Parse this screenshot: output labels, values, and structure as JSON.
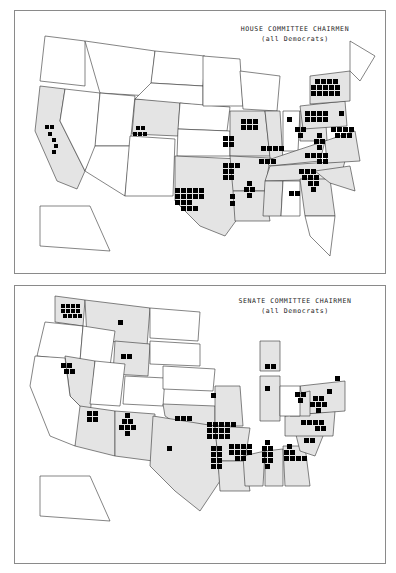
{
  "maps": [
    {
      "title": "HOUSE COMMITTEE CHAIRMEN",
      "subtitle": "(all Democrats)",
      "shaded_states": [
        "CA",
        "CO",
        "TX",
        "MO",
        "AR",
        "LA",
        "IL",
        "MS",
        "KY",
        "TN",
        "OH",
        "WV",
        "VA",
        "NC",
        "SC",
        "GA",
        "NY",
        "PA",
        "NJ",
        "MD"
      ],
      "chairmen_counts": {
        "CA": 6,
        "CO": 5,
        "TX": 16,
        "MO": 4,
        "AR": 7,
        "LA": 2,
        "IL": 6,
        "MS": 4,
        "KY": 4,
        "TN": 3,
        "OH": 1,
        "WV": 3,
        "VA": 4,
        "NC": 6,
        "SC": 9,
        "GA": 2,
        "NY": 14,
        "PA": 8,
        "NJ": 7,
        "MD": 1
      }
    },
    {
      "title": "SENATE COMMITTEE CHAIRMEN",
      "subtitle": "(all Democrats)",
      "shaded_states": [
        "WA",
        "MT",
        "WY",
        "NV",
        "AZ",
        "NM",
        "OK",
        "TX",
        "MO",
        "AR",
        "LA",
        "MS",
        "AL",
        "GA",
        "SC",
        "NC",
        "VA",
        "WV",
        "MI",
        "IN",
        "MD",
        "NJ"
      ],
      "chairmen_counts": {
        "WA": 12,
        "MT": 1,
        "WY": 2,
        "NV": 4,
        "AZ": 4,
        "NM": 7,
        "OK": 3,
        "TX": 1,
        "MO": 1,
        "AR": 13,
        "LA": 8,
        "MS": 10,
        "AL": 8,
        "GA": 7,
        "SC": 2,
        "NC": 6,
        "VA": 6,
        "WV": 3,
        "MI": 2,
        "IN": 1,
        "MD": 1,
        "NJ": 1
      }
    }
  ]
}
